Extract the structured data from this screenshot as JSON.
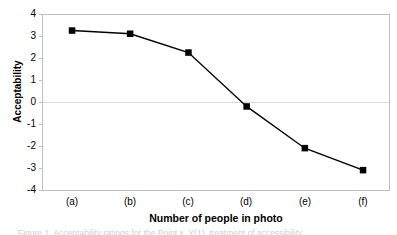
{
  "chart_data": {
    "type": "line",
    "title": "",
    "xlabel": "Number of people in photo",
    "ylabel": "Acceptability",
    "categories": [
      "(a)",
      "(b)",
      "(c)",
      "(d)",
      "(e)",
      "(f)"
    ],
    "values": [
      3.25,
      3.1,
      2.25,
      -0.2,
      -2.1,
      -3.1
    ],
    "series": [
      {
        "name": "Acceptability",
        "values": [
          3.25,
          3.1,
          2.25,
          -0.2,
          -2.1,
          -3.1
        ],
        "marker": "square",
        "marker_color": "#000000",
        "line_color": "#000000"
      }
    ],
    "ylim": [
      -4,
      4
    ],
    "yticks": [
      4,
      3,
      2,
      1,
      0,
      -1,
      -2,
      -3,
      -4
    ],
    "ytick_labels": [
      "4",
      "3",
      "2",
      "1",
      "0",
      "-1",
      "-2",
      "-3",
      "-4"
    ],
    "grid": "horizontal-zero-only",
    "legend": "none",
    "plot_border_color": "#bfbfbf",
    "zero_line_color": "#d9d9d9"
  },
  "axes": {
    "y_title": "Acceptability",
    "x_title": "Number of people in photo"
  },
  "caption": {
    "text": "Figure 1. Acceptability ratings for the Point x, Y(1), treatment of accessibility"
  }
}
